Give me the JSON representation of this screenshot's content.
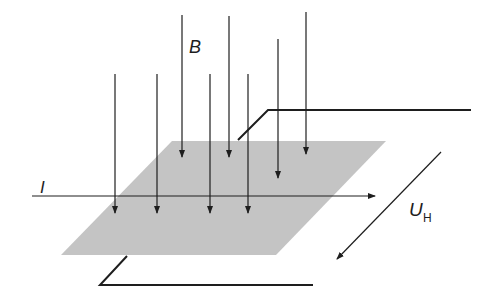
{
  "diagram": {
    "colors": {
      "plate": "#c4c4c4",
      "line": "#1e1e1e",
      "background": "#ffffff"
    },
    "plate": {
      "points": [
        [
          172,
          141
        ],
        [
          386,
          141
        ],
        [
          276,
          255
        ],
        [
          61,
          255
        ]
      ]
    },
    "field_arrows": [
      {
        "x": 115,
        "y1": 74,
        "y2": 213
      },
      {
        "x": 157,
        "y1": 74,
        "y2": 213
      },
      {
        "x": 182,
        "y1": 15,
        "y2": 157
      },
      {
        "x": 210,
        "y1": 74,
        "y2": 213
      },
      {
        "x": 229,
        "y1": 16,
        "y2": 157
      },
      {
        "x": 248,
        "y1": 74,
        "y2": 213
      },
      {
        "x": 278,
        "y1": 39,
        "y2": 178
      },
      {
        "x": 306,
        "y1": 12,
        "y2": 154
      }
    ],
    "current_line": {
      "x1": 32,
      "y1": 196,
      "x2": 375,
      "y2": 196
    },
    "hall_voltage_arrow": {
      "x1": 441,
      "y1": 152,
      "x2": 337,
      "y2": 259
    },
    "top_wire": [
      [
        238,
        140
      ],
      [
        268,
        110
      ],
      [
        471,
        110
      ]
    ],
    "bottom_wire": [
      [
        127,
        256
      ],
      [
        100,
        285
      ],
      [
        313,
        285
      ]
    ],
    "labels": {
      "B": "B",
      "I": "I",
      "U": "U",
      "U_sub": "H"
    }
  }
}
